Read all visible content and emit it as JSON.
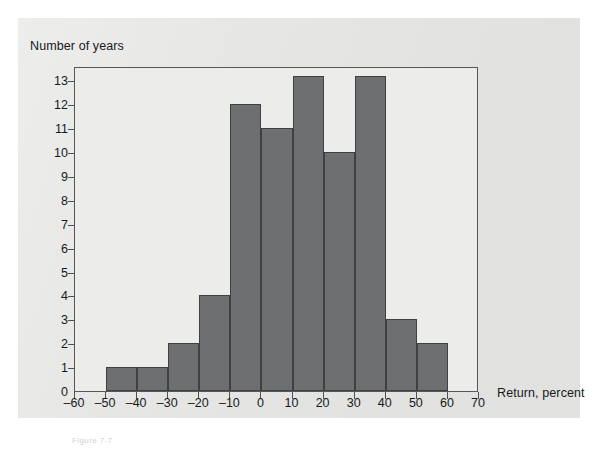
{
  "figure": {
    "y_axis_title": "Number of years",
    "x_axis_title": "Return, percent",
    "caption": "Figure 7-7"
  },
  "chart_data": {
    "type": "bar",
    "title": "",
    "subtitle": "",
    "xlabel": "Return, percent",
    "ylabel": "Number of years",
    "grid": false,
    "legend": false,
    "legend_position": "none",
    "bin_width": 10,
    "xlim": [
      -60,
      70
    ],
    "ylim": [
      0,
      13.6
    ],
    "xticks": [
      -60,
      -50,
      -40,
      -30,
      -20,
      -10,
      0,
      10,
      20,
      30,
      40,
      50,
      60,
      70
    ],
    "xtick_labels": [
      "–60",
      "–50",
      "–40",
      "–30",
      "–20",
      "–10",
      "0",
      "10",
      "20",
      "30",
      "40",
      "50",
      "60",
      "70"
    ],
    "yticks": [
      0,
      1,
      2,
      3,
      4,
      5,
      6,
      7,
      8,
      9,
      10,
      11,
      12,
      13
    ],
    "ytick_labels": [
      "0",
      "1",
      "2",
      "3",
      "4",
      "5",
      "6",
      "7",
      "8",
      "9",
      "10",
      "11",
      "12",
      "13"
    ],
    "bar_color": "#6d6f70",
    "bar_edge_color": "#3e4042",
    "plot_background": "#ececeb",
    "panel_background": "#e6e6e4",
    "categories": [
      "-60 to -50",
      "-50 to -40",
      "-40 to -30",
      "-30 to -20",
      "-20 to -10",
      "-10 to 0",
      "0 to 10",
      "10 to 20",
      "20 to 30",
      "30 to 40",
      "40 to 50",
      "50 to 60",
      "60 to 70"
    ],
    "bin_starts": [
      -60,
      -50,
      -40,
      -30,
      -20,
      -10,
      0,
      10,
      20,
      30,
      40,
      50,
      60
    ],
    "values": [
      0,
      1,
      1,
      2,
      4,
      12,
      11,
      13.2,
      10,
      13.2,
      3,
      2,
      0
    ]
  }
}
